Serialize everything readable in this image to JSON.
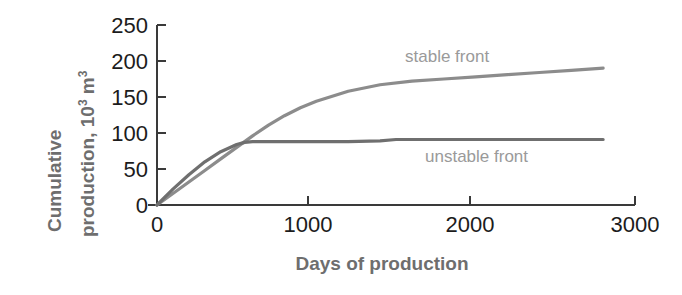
{
  "axes": {
    "y_label_line1": "Cumulative",
    "y_label_line2_prefix": "production, 10",
    "y_label_line2_sup": "3",
    "y_label_line2_suffix": " m",
    "y_label_line2_sup2": "3",
    "x_label": "Days of production"
  },
  "colors": {
    "axis": "#3a3a3a",
    "tick_text": "#1c1c1c",
    "axis_label": "#6e6e6e",
    "series_label": "#9a9a9a",
    "stable_line": "#8c8c8c",
    "unstable_line": "#6f6f6f",
    "background": "#ffffff"
  },
  "chart_data": {
    "type": "line",
    "title": "",
    "xlabel": "Days of production",
    "ylabel": "Cumulative production, 10^3 m^3",
    "xlim": [
      0,
      3000
    ],
    "ylim": [
      0,
      250
    ],
    "xticks": [
      0,
      1000,
      2000,
      3000
    ],
    "yticks": [
      0,
      50,
      100,
      150,
      200,
      250
    ],
    "xtick_labels": [
      "0",
      "1000",
      "2000",
      "3000"
    ],
    "ytick_labels": [
      "0",
      "50",
      "100",
      "150",
      "200",
      "250"
    ],
    "grid": false,
    "legend": "inline-annotations",
    "series": [
      {
        "name": "stable front",
        "label_text": "stable front",
        "x": [
          0,
          100,
          200,
          300,
          400,
          500,
          600,
          700,
          800,
          900,
          1000,
          1200,
          1400,
          1600,
          1800,
          2000,
          2200,
          2400,
          2600,
          2800
        ],
        "values": [
          0,
          16,
          32,
          48,
          64,
          80,
          96,
          111,
          124,
          135,
          144,
          158,
          167,
          172,
          175,
          178,
          181,
          184,
          187,
          190
        ]
      },
      {
        "name": "unstable front",
        "label_text": "unstable front",
        "x": [
          0,
          100,
          200,
          300,
          400,
          500,
          550,
          600,
          700,
          800,
          1000,
          1200,
          1400,
          1500,
          1700,
          2000,
          2300,
          2600,
          2800
        ],
        "values": [
          0,
          22,
          42,
          60,
          74,
          84,
          87,
          88,
          88,
          88,
          88,
          88,
          89,
          91,
          91,
          91,
          91,
          91,
          91
        ]
      }
    ]
  }
}
